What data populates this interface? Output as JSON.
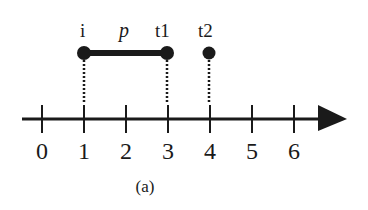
{
  "diagram": {
    "axis": {
      "ticks": [
        "0",
        "1",
        "2",
        "3",
        "4",
        "5",
        "6"
      ],
      "origin_x": 42,
      "unit_px": 42,
      "y": 119,
      "arrow_end_x": 347
    },
    "interval": {
      "start_label": "i",
      "end_label": "t1",
      "name_label": "p",
      "start_value": 1,
      "end_value": 3
    },
    "point": {
      "label": "t2",
      "value": 4
    },
    "dot_y": 53,
    "caption": "(a)",
    "color": "#1a1a1a"
  }
}
